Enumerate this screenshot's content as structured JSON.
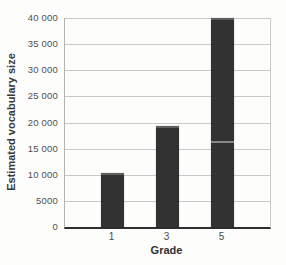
{
  "chart_data": {
    "type": "bar",
    "title": "",
    "categories": [
      "1",
      "3",
      "5"
    ],
    "values": [
      10400,
      19400,
      40000
    ],
    "xlabel": "Grade",
    "ylabel": "Estimated vocabulary size",
    "ylim": [
      0,
      40000
    ],
    "ytick_step": 5000,
    "ytick_labels": [
      "0",
      "5000",
      "10 000",
      "15 000",
      "20 000",
      "25 000",
      "30 000",
      "35 000",
      "40 000"
    ],
    "grid": true,
    "legend": false,
    "bar_color": "#323232",
    "bar_cap_color": "#5f5f5f",
    "gridline_color": "#c9c9c9",
    "axis_color": "#2e2e2e",
    "text_color": "#4a4a4a"
  }
}
